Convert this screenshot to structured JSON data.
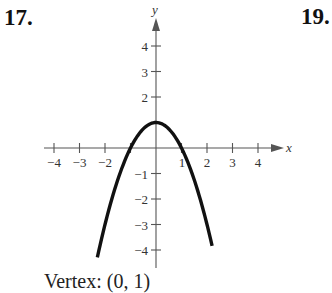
{
  "problems": {
    "left_number": "17.",
    "right_number": "19."
  },
  "graph": {
    "x_axis_label": "x",
    "y_axis_label": "y",
    "x_tick_labels": [
      "−4",
      "−3",
      "−2",
      "1",
      "2",
      "3",
      "4"
    ],
    "y_tick_labels": [
      "4",
      "3",
      "2",
      "−1",
      "−2",
      "−3",
      "−4"
    ],
    "caption": "Vertex: (0, 1)"
  },
  "chart_data": {
    "type": "line",
    "title": "",
    "xlabel": "x",
    "ylabel": "y",
    "xlim": [
      -4.5,
      5
    ],
    "ylim": [
      -4.5,
      5
    ],
    "grid": false,
    "x_ticks": [
      -4,
      -3,
      -2,
      -1,
      1,
      2,
      3,
      4
    ],
    "y_ticks": [
      -4,
      -3,
      -2,
      -1,
      1,
      2,
      3,
      4
    ],
    "x_tick_labels_shown": [
      -4,
      -3,
      -2,
      1,
      2,
      3,
      4
    ],
    "y_tick_labels_shown": [
      -4,
      -3,
      -2,
      -1,
      2,
      3,
      4
    ],
    "series": [
      {
        "name": "y = -x^2 + 1",
        "x": [
          -2.3,
          -2,
          -1.5,
          -1,
          -0.5,
          0,
          0.5,
          1,
          1.5,
          2,
          2.2
        ],
        "y": [
          -4.29,
          -3,
          -1.25,
          0,
          0.75,
          1,
          0.75,
          0,
          -1.25,
          -3,
          -3.84
        ]
      }
    ],
    "annotations": [
      "Vertex: (0, 1)"
    ]
  }
}
